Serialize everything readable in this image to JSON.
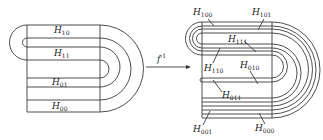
{
  "figure": {
    "left": {
      "title": "horseshoe-source",
      "labels": [
        {
          "id": "H10",
          "base": "H",
          "sub": "10",
          "x": 56,
          "y": 33
        },
        {
          "id": "H11",
          "base": "H",
          "sub": "11",
          "x": 56,
          "y": 56
        },
        {
          "id": "H01",
          "base": "H",
          "sub": "01",
          "x": 54,
          "y": 86
        },
        {
          "id": "H00",
          "base": "H",
          "sub": "00",
          "x": 54,
          "y": 110
        }
      ]
    },
    "arrow": {
      "label_base": "f",
      "label_sup": "-1"
    },
    "right": {
      "title": "horseshoe-preimage",
      "labels": [
        {
          "id": "H100",
          "base": "H",
          "sub": "100",
          "x": 193,
          "y": 15
        },
        {
          "id": "H101",
          "base": "H",
          "sub": "101",
          "x": 254,
          "y": 15
        },
        {
          "id": "H111",
          "base": "H",
          "sub": "111",
          "x": 229,
          "y": 44
        },
        {
          "id": "H110",
          "base": "H",
          "sub": "110",
          "x": 204,
          "y": 72
        },
        {
          "id": "H010",
          "base": "H",
          "sub": "010",
          "x": 241,
          "y": 69
        },
        {
          "id": "H011",
          "base": "H",
          "sub": "011",
          "x": 223,
          "y": 98
        },
        {
          "id": "H001",
          "base": "H",
          "sub": "001",
          "x": 193,
          "y": 132
        },
        {
          "id": "H000",
          "base": "H",
          "sub": "000",
          "x": 256,
          "y": 132
        }
      ]
    }
  }
}
